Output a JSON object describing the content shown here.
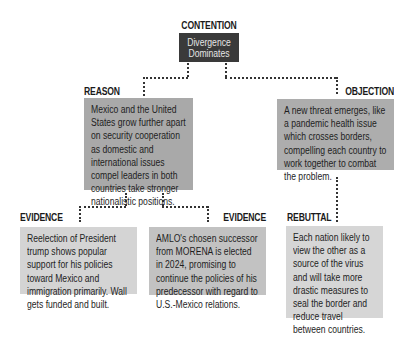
{
  "colors": {
    "contention_box": "#3a3a3a",
    "reason_box": "#a9a9a9",
    "objection_box": "#adadad",
    "evidence1_box": "#d4d4d4",
    "evidence2_box": "#c2c2c2",
    "rebuttal_box": "#d6d6d6",
    "connector": "#333333"
  },
  "contention": {
    "label": "CONTENTION",
    "text": "Divergence Dominates"
  },
  "reason": {
    "label": "REASON",
    "text": "Mexico and the United States grow further apart on security cooperation as domestic and international issues compel leaders in both countries take stronger nationalistic positions."
  },
  "objection": {
    "label": "OBJECTION",
    "text": "A new threat emerges, like a pandemic health issue which crosses borders, compelling each country to work together to combat the problem."
  },
  "evidence_1": {
    "label": "EVIDENCE",
    "text": "Reelection of President trump shows popular support for his policies toward Mexico and immigration primarily. Wall gets funded and built."
  },
  "evidence_2": {
    "label": "EVIDENCE",
    "text": "AMLO's chosen successor from MORENA is elected in 2024, promising to continue the policies of his predecessor with regard to U.S.-Mexico relations."
  },
  "rebuttal": {
    "label": "REBUTTAL",
    "text": "Each nation likely to view the other as a source of the virus and will take more drastic measures to seal the border and reduce travel between countries."
  }
}
